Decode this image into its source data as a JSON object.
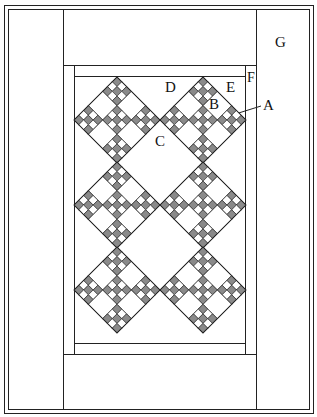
{
  "diagram": {
    "labels": {
      "A": "A",
      "B": "B",
      "C": "C",
      "D": "D",
      "E": "E",
      "F": "F",
      "G": "G"
    },
    "colors": {
      "line": "#222222",
      "square_fill": "#8a8a8a",
      "background": "#ffffff"
    },
    "blocks": {
      "columns": 2,
      "rows": 3,
      "type": "Nine-patch of nine-patches, set on point"
    }
  }
}
